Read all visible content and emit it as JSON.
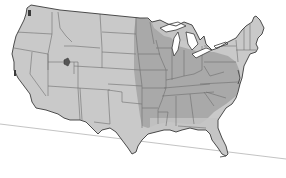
{
  "map": {
    "title": "United States map",
    "colors": {
      "background": "#ffffff",
      "land": "#c9c9c9",
      "highlight_region": "#a9a9a9",
      "border": "#6e6e6e",
      "coast": "#3a3a3a",
      "marker": "#555555",
      "baseline": "#b4b4b4"
    },
    "highlight_region_description": "Central and eastern states shaded darker (Great Plains east edge through Midwest, Southeast and Appalachians)",
    "marker": {
      "description": "small dark marker in northern Utah"
    }
  }
}
